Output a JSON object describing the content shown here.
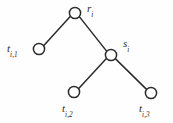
{
  "figure": {
    "type": "tree-diagram",
    "caption": "",
    "background_color": "#fefefe",
    "ink_color": "#2b2b2b",
    "width": 173,
    "height": 123
  },
  "nodes": [
    {
      "id": "r",
      "label_base": "r",
      "label_sub": "i",
      "label_full": "r_i",
      "role": "root",
      "cx": 75,
      "cy": 13,
      "r": 5.6,
      "label_x": 87,
      "label_y": 3
    },
    {
      "id": "s",
      "label_base": "s",
      "label_sub": "i",
      "label_full": "s_i",
      "role": "internal",
      "cx": 111,
      "cy": 55,
      "r": 5.6,
      "label_x": 123,
      "label_y": 38
    },
    {
      "id": "t1",
      "label_base": "t",
      "label_sub": "i,1",
      "label_full": "t_{i,1}",
      "role": "leaf",
      "cx": 39,
      "cy": 49,
      "r": 5.6,
      "label_x": 7,
      "label_y": 43
    },
    {
      "id": "t2",
      "label_base": "t",
      "label_sub": "i,2",
      "label_full": "t_{i,2}",
      "role": "leaf",
      "cx": 74,
      "cy": 92,
      "r": 5.6,
      "label_x": 62,
      "label_y": 103
    },
    {
      "id": "t3",
      "label_base": "t",
      "label_sub": "i,3",
      "label_full": "t_{i,3}",
      "role": "leaf",
      "cx": 151,
      "cy": 93,
      "r": 5.6,
      "label_x": 139,
      "label_y": 103
    }
  ],
  "edges": [
    {
      "id": "r-t1",
      "from": "r",
      "to": "t1",
      "x1": 70.4,
      "y1": 16.2,
      "x2": 43.4,
      "y2": 45.9
    },
    {
      "id": "r-s",
      "from": "r",
      "to": "s",
      "x1": 79.3,
      "y1": 16.6,
      "x2": 106.8,
      "y2": 51.4
    },
    {
      "id": "s-t2",
      "from": "s",
      "to": "t2",
      "x1": 106.6,
      "y1": 58.3,
      "x2": 78.5,
      "y2": 88.7
    },
    {
      "id": "s-t3",
      "from": "s",
      "to": "t3",
      "x1": 115.3,
      "y1": 58.6,
      "x2": 146.8,
      "y2": 89.6
    }
  ]
}
